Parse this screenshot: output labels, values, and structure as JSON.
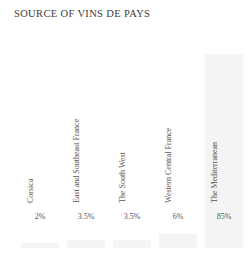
{
  "chart_data": {
    "type": "bar",
    "title": "SOURCE OF VINS DE PAYS",
    "xlabel": "",
    "ylabel": "",
    "ylim": [
      0,
      100
    ],
    "grid": false,
    "legend": false,
    "categories": [
      "Corsica",
      "East and Southeast France",
      "The South West",
      "Western Central France",
      "The Mediterranean"
    ],
    "values": [
      2,
      3.5,
      3.5,
      6,
      85
    ],
    "value_labels": [
      "2%",
      "3.5%",
      "3.5%",
      "6%",
      "85%"
    ],
    "bar_color": "#f4f4f4",
    "text_color": "#555555",
    "title_color": "#3d3d3d"
  }
}
